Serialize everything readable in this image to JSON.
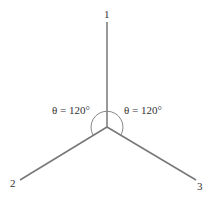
{
  "diagram": {
    "type": "three-phase wye / vector diagram",
    "center": [
      107,
      127
    ],
    "branches": [
      {
        "label": "1",
        "end": [
          107,
          22
        ]
      },
      {
        "label": "2",
        "end": [
          20,
          180
        ]
      },
      {
        "label": "3",
        "end": [
          196,
          180
        ]
      }
    ],
    "angles": [
      {
        "text": "θ = 120°",
        "side": "left"
      },
      {
        "text": "θ = 120°",
        "side": "right"
      }
    ],
    "colors": {
      "line": "#777777",
      "text": "#333333"
    }
  }
}
